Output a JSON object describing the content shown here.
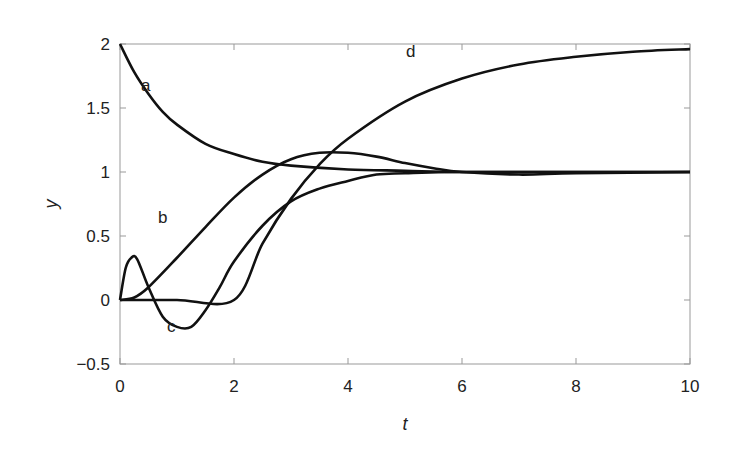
{
  "chart_data": {
    "type": "line",
    "title": "",
    "xlabel": "t",
    "ylabel": "y",
    "xlim": [
      0,
      10
    ],
    "ylim": [
      -0.5,
      2
    ],
    "xticks": [
      0,
      2,
      4,
      6,
      8,
      10
    ],
    "yticks": [
      -0.5,
      0,
      0.5,
      1,
      1.5,
      2
    ],
    "xtick_labels": [
      "0",
      "2",
      "4",
      "6",
      "8",
      "10"
    ],
    "ytick_labels": [
      "−0.5",
      "0",
      "0.5",
      "1",
      "1.5",
      "2"
    ],
    "grid": false,
    "legend": "none (inline curve labels)",
    "series": [
      {
        "name": "a",
        "x": [
          0,
          0.25,
          0.5,
          0.75,
          1,
          1.5,
          2,
          2.5,
          3,
          4,
          5,
          6,
          8,
          10
        ],
        "values": [
          2.0,
          1.78,
          1.61,
          1.47,
          1.37,
          1.22,
          1.14,
          1.08,
          1.05,
          1.02,
          1.01,
          1.0,
          1.0,
          1.0
        ]
      },
      {
        "name": "b",
        "x": [
          0,
          0.25,
          0.5,
          1,
          1.5,
          2,
          2.5,
          3,
          3.5,
          4,
          4.5,
          5,
          5.5,
          6,
          7,
          8,
          10
        ],
        "values": [
          0,
          0.02,
          0.1,
          0.33,
          0.57,
          0.8,
          0.98,
          1.1,
          1.15,
          1.15,
          1.12,
          1.07,
          1.03,
          1.0,
          0.98,
          0.99,
          1.0
        ]
      },
      {
        "name": "c",
        "x": [
          0,
          0.1,
          0.2,
          0.3,
          0.5,
          0.75,
          1,
          1.25,
          1.5,
          1.75,
          2,
          2.5,
          3,
          3.5,
          4,
          4.5,
          5,
          6,
          8,
          10
        ],
        "values": [
          0,
          0.25,
          0.33,
          0.32,
          0.1,
          -0.13,
          -0.21,
          -0.21,
          -0.08,
          0.1,
          0.3,
          0.58,
          0.77,
          0.87,
          0.93,
          0.98,
          0.99,
          1.0,
          1.0,
          1.0
        ]
      },
      {
        "name": "d",
        "x": [
          0,
          1,
          2,
          2.5,
          3,
          3.5,
          4,
          5,
          6,
          7,
          8,
          9,
          10
        ],
        "values": [
          0,
          0,
          0,
          0.44,
          0.79,
          1.06,
          1.26,
          1.55,
          1.73,
          1.84,
          1.9,
          1.94,
          1.96
        ]
      }
    ],
    "annotations": [
      {
        "text": "a",
        "x": 0.45,
        "y": 1.63
      },
      {
        "text": "b",
        "x": 0.75,
        "y": 0.6
      },
      {
        "text": "c",
        "x": 0.9,
        "y": -0.25
      },
      {
        "text": "d",
        "x": 5.1,
        "y": 1.9
      }
    ]
  }
}
